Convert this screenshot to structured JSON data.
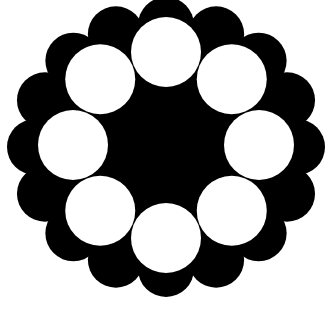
{
  "figure": {
    "background_color": "#ffffff",
    "fill_color": "#000000",
    "hole_color": "#ffffff",
    "center": [
      166,
      147
    ],
    "outer_body_radius": 124,
    "scallop_count": 16,
    "scallop_ring_radius_x": 131,
    "scallop_ring_radius_y": 122,
    "scallop_radius": 28,
    "hole_count": 8,
    "hole_ring_radius": 93,
    "hole_radius": 35
  }
}
